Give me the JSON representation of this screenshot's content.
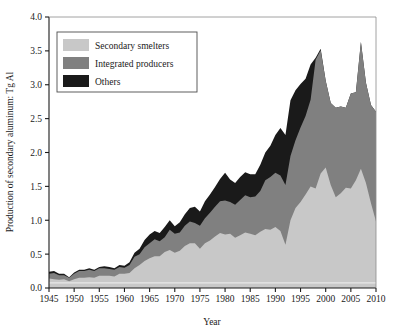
{
  "chart_data": {
    "type": "area",
    "stacked": true,
    "title": "",
    "subtitle": "",
    "xlabel": "Year",
    "ylabel": "Production of secondary aluminum: Tg Al",
    "xlim": [
      1945,
      2010
    ],
    "ylim": [
      0.0,
      4.0
    ],
    "grid": false,
    "legend_position": "top-left",
    "xticks": [
      1945,
      1950,
      1955,
      1960,
      1965,
      1970,
      1975,
      1980,
      1985,
      1990,
      1995,
      2000,
      2005,
      2010
    ],
    "xtick_labels": [
      "1945",
      "1950",
      "1955",
      "1960",
      "1965",
      "1970",
      "1975",
      "1980",
      "1985",
      "1990",
      "1995",
      "2000",
      "2005",
      "2010"
    ],
    "yticks": [
      0.0,
      0.5,
      1.0,
      1.5,
      2.0,
      2.5,
      3.0,
      3.5,
      4.0
    ],
    "ytick_labels": [
      "0.0",
      "0.5",
      "1.0",
      "1.5",
      "2.0",
      "2.5",
      "3.0",
      "3.5",
      "4.0"
    ],
    "x": [
      1945,
      1946,
      1947,
      1948,
      1949,
      1950,
      1951,
      1952,
      1953,
      1954,
      1955,
      1956,
      1957,
      1958,
      1959,
      1960,
      1961,
      1962,
      1963,
      1964,
      1965,
      1966,
      1967,
      1968,
      1969,
      1970,
      1971,
      1972,
      1973,
      1974,
      1975,
      1976,
      1977,
      1978,
      1979,
      1980,
      1981,
      1982,
      1983,
      1984,
      1985,
      1986,
      1987,
      1988,
      1989,
      1990,
      1991,
      1992,
      1993,
      1994,
      1995,
      1996,
      1997,
      1998,
      1999,
      2000,
      2001,
      2002,
      2003,
      2004,
      2005,
      2006,
      2007,
      2008,
      2009,
      2010
    ],
    "series": [
      {
        "name": "Secondary smelters",
        "color": "#c8c8c8",
        "values": [
          0.14,
          0.13,
          0.12,
          0.13,
          0.1,
          0.13,
          0.15,
          0.15,
          0.16,
          0.15,
          0.18,
          0.18,
          0.18,
          0.17,
          0.21,
          0.21,
          0.22,
          0.29,
          0.34,
          0.4,
          0.44,
          0.47,
          0.47,
          0.53,
          0.56,
          0.52,
          0.55,
          0.62,
          0.66,
          0.66,
          0.58,
          0.66,
          0.7,
          0.76,
          0.81,
          0.79,
          0.8,
          0.74,
          0.78,
          0.82,
          0.8,
          0.78,
          0.83,
          0.87,
          0.86,
          0.9,
          0.84,
          0.64,
          1.0,
          1.18,
          1.27,
          1.38,
          1.5,
          1.47,
          1.69,
          1.78,
          1.52,
          1.34,
          1.4,
          1.48,
          1.47,
          1.59,
          1.76,
          1.55,
          1.25,
          0.98
        ]
      },
      {
        "name": "Integrated producers",
        "color": "#808080",
        "values": [
          0.07,
          0.09,
          0.07,
          0.06,
          0.05,
          0.08,
          0.1,
          0.1,
          0.11,
          0.1,
          0.11,
          0.11,
          0.1,
          0.1,
          0.1,
          0.09,
          0.12,
          0.17,
          0.16,
          0.2,
          0.22,
          0.25,
          0.22,
          0.22,
          0.3,
          0.28,
          0.27,
          0.3,
          0.32,
          0.3,
          0.34,
          0.37,
          0.41,
          0.44,
          0.47,
          0.5,
          0.47,
          0.49,
          0.52,
          0.55,
          0.54,
          0.57,
          0.6,
          0.72,
          0.78,
          0.8,
          0.82,
          0.88,
          0.95,
          1.0,
          1.1,
          1.16,
          1.28,
          1.9,
          1.82,
          1.28,
          1.21,
          1.32,
          1.28,
          1.18,
          1.4,
          1.3,
          1.87,
          1.48,
          1.45,
          1.62
        ]
      },
      {
        "name": "Others",
        "color": "#1a1a1a",
        "values": [
          0.03,
          0.03,
          0.02,
          0.02,
          0.01,
          0.02,
          0.02,
          0.02,
          0.02,
          0.02,
          0.02,
          0.03,
          0.03,
          0.02,
          0.03,
          0.03,
          0.04,
          0.06,
          0.08,
          0.11,
          0.13,
          0.12,
          0.12,
          0.15,
          0.14,
          0.11,
          0.15,
          0.17,
          0.2,
          0.24,
          0.21,
          0.25,
          0.27,
          0.29,
          0.33,
          0.41,
          0.33,
          0.32,
          0.34,
          0.34,
          0.34,
          0.33,
          0.39,
          0.41,
          0.46,
          0.56,
          0.7,
          0.74,
          0.82,
          0.74,
          0.64,
          0.55,
          0.52,
          0.03,
          0.02,
          0.0,
          0.0,
          0.0,
          0.0,
          0.0,
          0.0,
          0.0,
          0.0,
          0.0,
          0.0,
          0.0
        ]
      }
    ]
  },
  "legend": {
    "items": [
      {
        "label": "Secondary smelters",
        "color": "#c8c8c8"
      },
      {
        "label": "Integrated producers",
        "color": "#808080"
      },
      {
        "label": "Others",
        "color": "#1a1a1a"
      }
    ]
  },
  "axes": {
    "x_title": "Year",
    "y_title": "Production of secondary aluminum: Tg Al"
  }
}
